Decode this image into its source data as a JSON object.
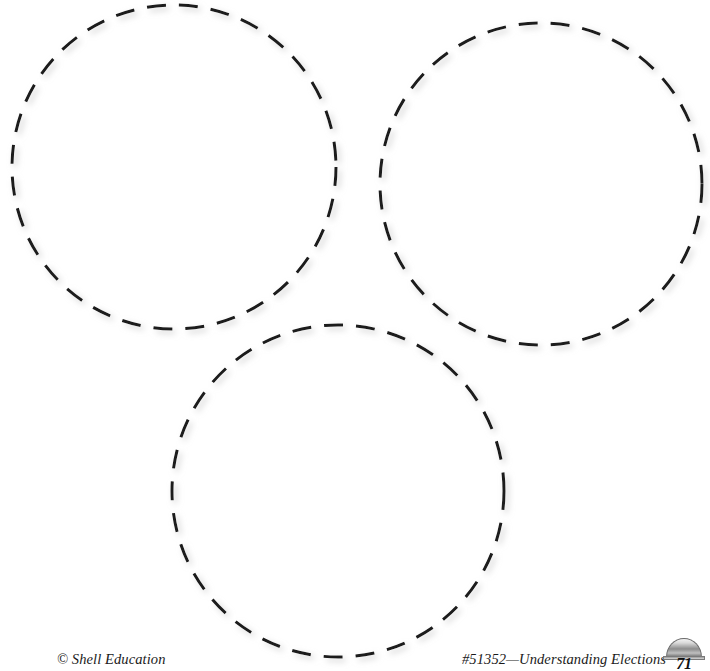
{
  "page": {
    "width": 710,
    "height": 671,
    "background_color": "#ffffff"
  },
  "worksheet": {
    "shape_type": "dashed-circle",
    "stroke_color": "#1a1a1a",
    "stroke_width": 3,
    "dash_length": 19,
    "dash_gap": 13,
    "circles": [
      {
        "id": "circle-top-left",
        "label": "Circle 1",
        "cx": 174,
        "cy": 167,
        "r": 162
      },
      {
        "id": "circle-top-right",
        "label": "Circle 2",
        "cx": 541,
        "cy": 184,
        "r": 161
      },
      {
        "id": "circle-bottom",
        "label": "Circle 3",
        "cx": 338,
        "cy": 491,
        "r": 166
      }
    ]
  },
  "footer": {
    "copyright": "© Shell Education",
    "product": "#51352—Understanding Elections",
    "page_number": "71",
    "badge_icon": "capitol-dome-icon"
  }
}
